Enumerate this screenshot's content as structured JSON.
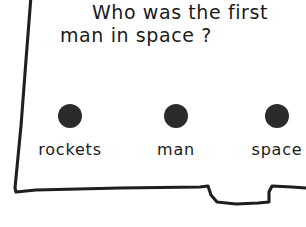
{
  "card": {
    "question_line_1": "Who was the first",
    "question_line_2": "man in space ?",
    "ink_color": "#1a1a1a",
    "dot_color": "#2b2b2b",
    "paper_color": "#ffffff"
  },
  "options": [
    {
      "label": "rockets",
      "dot": "filled-circle-icon"
    },
    {
      "label": "man",
      "dot": "filled-circle-icon"
    },
    {
      "label": "space",
      "dot": "filled-circle-icon"
    }
  ]
}
